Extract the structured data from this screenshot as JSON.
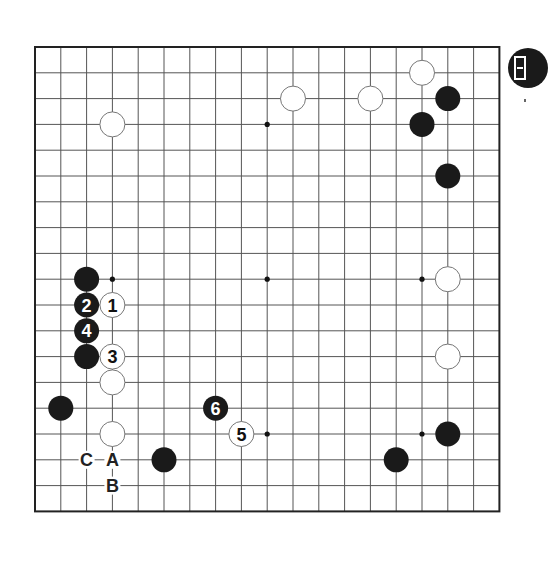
{
  "board": {
    "size": 19,
    "origin_x": 35,
    "origin_y": 47,
    "spacing": 25.8,
    "stone_radius": 12.5,
    "line_color": "#555555",
    "frame_color": "#222222",
    "black_color": "#1a1a1a",
    "white_color": "#ffffff",
    "white_outline": "#777777",
    "star_points": [
      [
        3,
        3
      ],
      [
        9,
        3
      ],
      [
        15,
        3
      ],
      [
        3,
        9
      ],
      [
        9,
        9
      ],
      [
        15,
        9
      ],
      [
        3,
        15
      ],
      [
        9,
        15
      ],
      [
        15,
        15
      ]
    ]
  },
  "stones": [
    {
      "color": "white",
      "col": 3,
      "row": 3,
      "label": ""
    },
    {
      "color": "white",
      "col": 10,
      "row": 2,
      "label": ""
    },
    {
      "color": "white",
      "col": 13,
      "row": 2,
      "label": ""
    },
    {
      "color": "white",
      "col": 15,
      "row": 1,
      "label": ""
    },
    {
      "color": "black",
      "col": 16,
      "row": 2,
      "label": ""
    },
    {
      "color": "black",
      "col": 15,
      "row": 3,
      "label": ""
    },
    {
      "color": "black",
      "col": 16,
      "row": 5,
      "label": ""
    },
    {
      "color": "black",
      "col": 2,
      "row": 9,
      "label": ""
    },
    {
      "color": "white",
      "col": 3,
      "row": 10,
      "label": "1"
    },
    {
      "color": "black",
      "col": 2,
      "row": 10,
      "label": "2"
    },
    {
      "color": "white",
      "col": 3,
      "row": 12,
      "label": "3"
    },
    {
      "color": "black",
      "col": 2,
      "row": 11,
      "label": "4"
    },
    {
      "color": "white",
      "col": 8,
      "row": 15,
      "label": "5"
    },
    {
      "color": "black",
      "col": 7,
      "row": 14,
      "label": "6"
    },
    {
      "color": "black",
      "col": 2,
      "row": 12,
      "label": ""
    },
    {
      "color": "white",
      "col": 3,
      "row": 13,
      "label": ""
    },
    {
      "color": "black",
      "col": 1,
      "row": 14,
      "label": ""
    },
    {
      "color": "white",
      "col": 3,
      "row": 15,
      "label": ""
    },
    {
      "color": "black",
      "col": 5,
      "row": 16,
      "label": ""
    },
    {
      "color": "white",
      "col": 16,
      "row": 9,
      "label": ""
    },
    {
      "color": "white",
      "col": 16,
      "row": 12,
      "label": ""
    },
    {
      "color": "black",
      "col": 16,
      "row": 15,
      "label": ""
    },
    {
      "color": "black",
      "col": 14,
      "row": 16,
      "label": ""
    }
  ],
  "markers": [
    {
      "text": "A",
      "col": 3,
      "row": 16
    },
    {
      "text": "B",
      "col": 3,
      "row": 17
    },
    {
      "text": "C",
      "col": 2,
      "row": 16
    }
  ],
  "badge": {
    "icon": "problem-number-badge-icon"
  }
}
